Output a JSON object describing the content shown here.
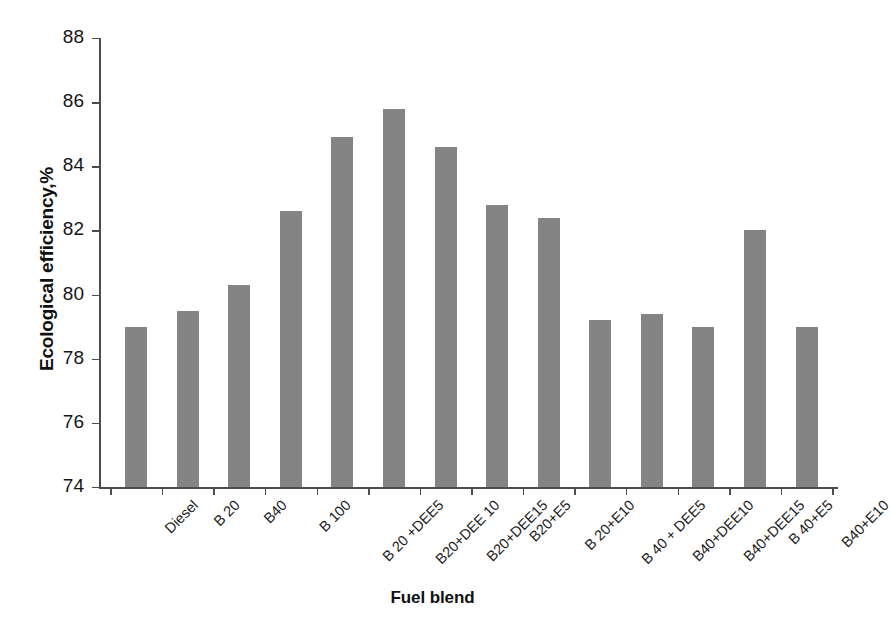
{
  "chart_data": {
    "type": "bar",
    "title": "",
    "xlabel": "Fuel blend",
    "ylabel": "Ecological efficiency,%",
    "ylim": [
      74,
      88
    ],
    "ytick_step": 2,
    "yticks": [
      74,
      76,
      78,
      80,
      82,
      84,
      86,
      88
    ],
    "ytick_labels": [
      "74",
      "76",
      "78",
      "80",
      "82",
      "84",
      "86",
      "88"
    ],
    "grid": false,
    "legend": null,
    "bar_color": "#848484",
    "axis_color": "#4d4d4d",
    "categories": [
      "Diesel",
      "B 20",
      "B40",
      "B 100",
      "B 20 +DEE5",
      "B20+DEE 10",
      "B20+DEE15",
      "B20+E5",
      "B 20+E10",
      "B 40 + DEE5",
      "B40+DEE10",
      "B40+DEE15",
      "B 40+E5",
      "B40+E10"
    ],
    "values": [
      79.0,
      79.5,
      80.3,
      82.6,
      84.9,
      85.8,
      84.6,
      82.8,
      82.4,
      79.2,
      79.4,
      79.0,
      82.0,
      79.0
    ],
    "series": [
      {
        "name": "Ecological efficiency",
        "values": [
          79.0,
          79.5,
          80.3,
          82.6,
          84.9,
          85.8,
          84.6,
          82.8,
          82.4,
          79.2,
          79.4,
          79.0,
          82.0,
          79.0
        ]
      }
    ]
  }
}
